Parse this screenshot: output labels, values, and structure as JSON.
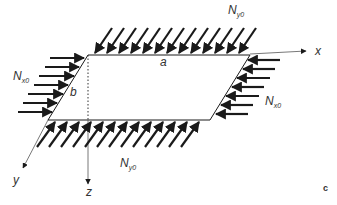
{
  "figure": {
    "panel_label": "c",
    "colors": {
      "stroke": "#1a1a1a",
      "axis": "#555555",
      "text": "#333333"
    },
    "plate": {
      "edge_a_label": "a",
      "edge_b_label": "b",
      "corners": [
        [
          88,
          55
        ],
        [
          250,
          55
        ],
        [
          210,
          120
        ],
        [
          48,
          120
        ]
      ]
    },
    "axes": {
      "x": {
        "label": "x"
      },
      "y": {
        "label": "y"
      },
      "z": {
        "label": "z"
      }
    },
    "loads": {
      "top": {
        "symbol": "N",
        "subscript": "y0",
        "arrow_count": 14
      },
      "bottom": {
        "symbol": "N",
        "subscript": "y0",
        "arrow_count": 14
      },
      "left": {
        "symbol": "N",
        "subscript": "x0",
        "arrow_count": 7
      },
      "right": {
        "symbol": "N",
        "subscript": "x0",
        "arrow_count": 7
      }
    }
  }
}
